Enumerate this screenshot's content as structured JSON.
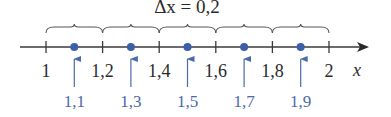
{
  "diagram": {
    "title": "Δx = 0,2",
    "axis": {
      "variable": "x",
      "min": 1,
      "max": 2,
      "step": 0.2,
      "color": "#3a3a3a"
    },
    "ticks": [
      {
        "value": 1.0,
        "label": "1"
      },
      {
        "value": 1.2,
        "label": "1,2"
      },
      {
        "value": 1.4,
        "label": "1,4"
      },
      {
        "value": 1.6,
        "label": "1,6"
      },
      {
        "value": 1.8,
        "label": "1,8"
      },
      {
        "value": 2.0,
        "label": "2"
      }
    ],
    "midpoints": [
      {
        "value": 1.1,
        "label": "1,1"
      },
      {
        "value": 1.3,
        "label": "1,3"
      },
      {
        "value": 1.5,
        "label": "1,5"
      },
      {
        "value": 1.7,
        "label": "1,7"
      },
      {
        "value": 1.9,
        "label": "1,9"
      }
    ],
    "colors": {
      "midpoint_dot": "#3b5fa8",
      "midpoint_arrow": "#4a6aa8",
      "midpoint_label": "#4a6aa8",
      "brace": "#555555"
    }
  }
}
